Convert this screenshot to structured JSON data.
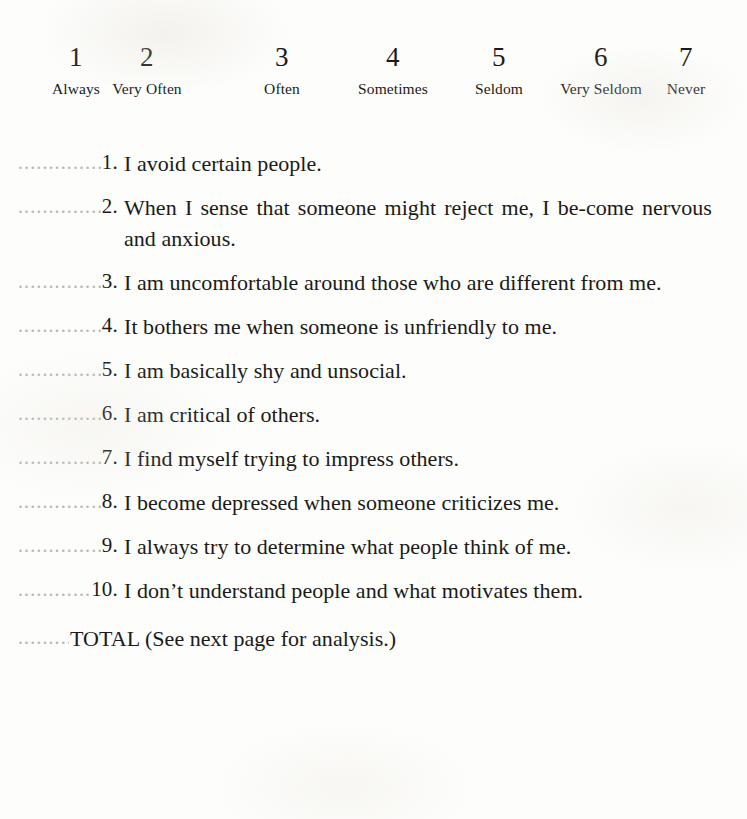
{
  "scale": {
    "points": [
      {
        "number": "1",
        "label": "Always",
        "x": 76
      },
      {
        "number": "2",
        "label": "Very Often",
        "x": 147
      },
      {
        "number": "3",
        "label": "Often",
        "x": 282
      },
      {
        "number": "4",
        "label": "Sometimes",
        "x": 393
      },
      {
        "number": "5",
        "label": "Seldom",
        "x": 499
      },
      {
        "number": "6",
        "label": "Very Seldom",
        "x": 601
      },
      {
        "number": "7",
        "label": "Never",
        "x": 686
      }
    ]
  },
  "leader_dots": "...............",
  "items": [
    {
      "number": "1.",
      "text": "I avoid certain people."
    },
    {
      "number": "2.",
      "text": "When I sense that someone might reject me, I be‐come nervous and anxious."
    },
    {
      "number": "3.",
      "text": "I am uncomfortable around those who are different from me."
    },
    {
      "number": "4.",
      "text": "It bothers me when someone is unfriendly to me."
    },
    {
      "number": "5.",
      "text": "I am basically shy and unsocial."
    },
    {
      "number": "6.",
      "text": "I am critical of others."
    },
    {
      "number": "7.",
      "text": "I find myself trying to impress others."
    },
    {
      "number": "8.",
      "text": "I become depressed when someone criticizes me."
    },
    {
      "number": "9.",
      "text": "I always try to determine what people think of me."
    },
    {
      "number": "10.",
      "text": "I don’t understand people and what motivates them."
    }
  ],
  "total": {
    "label": "TOTAL (See next page for analysis.)"
  },
  "colors": {
    "paper": "#fdfdfb",
    "ink": "#1a1a18",
    "leader": "#b9b7b2"
  }
}
